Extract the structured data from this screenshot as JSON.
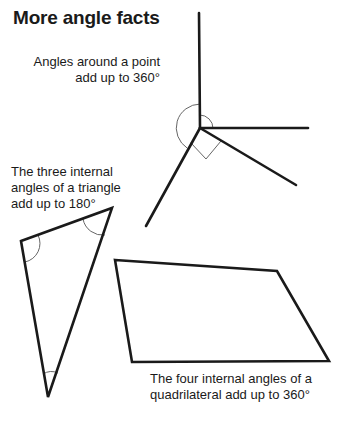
{
  "title": "More angle facts",
  "labels": {
    "point": [
      "Angles around a point",
      "add up to 360°"
    ],
    "triangle": [
      "The three internal",
      "angles of a triangle",
      "add up to 180°"
    ],
    "quadrilateral": [
      "The four internal angles of a",
      "quadrilateral add up to 360°"
    ]
  },
  "colors": {
    "stroke": "#1a1a1a",
    "arc": "#666666",
    "background": "#ffffff"
  },
  "shapes": {
    "point_center": [
      200,
      128
    ],
    "point_rays": [
      [
        199,
        13
      ],
      [
        308,
        128
      ],
      [
        296,
        185
      ],
      [
        146,
        226
      ]
    ],
    "triangle": [
      [
        21,
        241
      ],
      [
        112,
        208
      ],
      [
        48,
        397
      ]
    ],
    "quadrilateral": [
      [
        115,
        260
      ],
      [
        277,
        271
      ],
      [
        329,
        361
      ],
      [
        132,
        362
      ]
    ]
  }
}
